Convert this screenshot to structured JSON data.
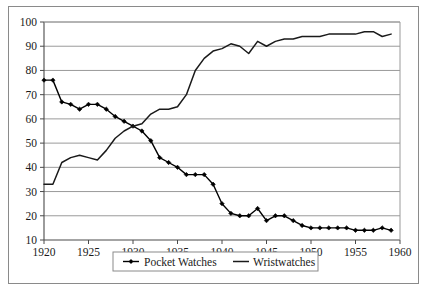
{
  "chart_data": {
    "type": "line",
    "title": "",
    "xlabel": "",
    "ylabel": "",
    "xlim": [
      1920,
      1960
    ],
    "ylim": [
      10,
      100
    ],
    "grid": true,
    "grid_axis": "y",
    "legend_position": "bottom-center",
    "xticks": [
      1920,
      1925,
      1930,
      1935,
      1940,
      1945,
      1950,
      1955,
      1960
    ],
    "xtick_labels": [
      "1920",
      "1925",
      "1930",
      "1935",
      "1940",
      "1945",
      "1950",
      "1955",
      "1960"
    ],
    "yticks": [
      10,
      20,
      30,
      40,
      50,
      60,
      70,
      80,
      90,
      100
    ],
    "ytick_labels": [
      "10",
      "20",
      "30",
      "40",
      "50",
      "60",
      "70",
      "80",
      "90",
      "100"
    ],
    "x": [
      1920,
      1921,
      1922,
      1923,
      1924,
      1925,
      1926,
      1927,
      1928,
      1929,
      1930,
      1931,
      1932,
      1933,
      1934,
      1935,
      1936,
      1937,
      1938,
      1939,
      1940,
      1941,
      1942,
      1943,
      1944,
      1945,
      1946,
      1947,
      1948,
      1949,
      1950,
      1951,
      1952,
      1953,
      1954,
      1955,
      1956,
      1957,
      1958,
      1959
    ],
    "series": [
      {
        "name": "Pocket Watches",
        "marker": "diamond",
        "color": "#000000",
        "values": [
          76,
          76,
          67,
          66,
          64,
          66,
          66,
          64,
          61,
          59,
          57,
          55,
          51,
          44,
          42,
          40,
          37,
          37,
          37,
          33,
          25,
          21,
          20,
          20,
          23,
          18,
          20,
          20,
          18,
          16,
          15,
          15,
          15,
          15,
          15,
          14,
          14,
          14,
          15,
          14
        ]
      },
      {
        "name": "Wristwatches",
        "marker": "none",
        "color": "#1a1a1a",
        "values": [
          33,
          33,
          42,
          44,
          45,
          44,
          43,
          47,
          52,
          55,
          57,
          58,
          62,
          64,
          64,
          65,
          70,
          80,
          85,
          88,
          89,
          91,
          90,
          87,
          92,
          90,
          92,
          93,
          93,
          94,
          94,
          94,
          95,
          95,
          95,
          95,
          96,
          96,
          94,
          95
        ]
      }
    ]
  },
  "legend": {
    "entries": [
      {
        "label": "Pocket Watches",
        "marker": "diamond-line"
      },
      {
        "label": "Wristwatches",
        "marker": "line"
      }
    ]
  }
}
